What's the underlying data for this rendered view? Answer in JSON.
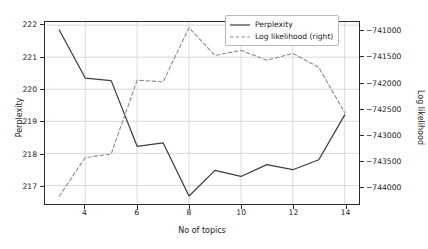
{
  "chart_data": {
    "type": "line",
    "title": "",
    "xlabel": "No of topics",
    "ylabel": "Perplexity",
    "y2label": "Log likelihood",
    "grid": true,
    "legend_position": "top-right",
    "x": [
      3,
      4,
      5,
      6,
      7,
      8,
      9,
      10,
      11,
      12,
      13,
      14
    ],
    "xlim": [
      2.45,
      14.55
    ],
    "xticks": [
      4,
      6,
      8,
      10,
      12,
      14
    ],
    "ylim": [
      216.42,
      222.1
    ],
    "yticks": [
      217,
      218,
      219,
      220,
      221,
      222
    ],
    "y2lim": [
      -744350,
      -740820
    ],
    "y2ticks": [
      -741000,
      -741500,
      -742000,
      -742500,
      -743000,
      -743500,
      -744000
    ],
    "series": [
      {
        "name": "Perplexity",
        "axis": "left",
        "style": "solid",
        "color": "#3d3d3d",
        "values": [
          221.85,
          220.35,
          220.27,
          218.22,
          218.33,
          216.67,
          217.47,
          217.28,
          217.65,
          217.49,
          217.8,
          219.2
        ]
      },
      {
        "name": "Log likelihood (right)",
        "axis": "right",
        "style": "dashed",
        "color": "#8a8a8a",
        "values": [
          -744200,
          -743450,
          -743380,
          -741950,
          -741980,
          -740930,
          -741470,
          -741370,
          -741560,
          -741430,
          -741700,
          -742580
        ]
      }
    ]
  },
  "legend": {
    "entries": [
      {
        "label": "Perplexity"
      },
      {
        "label": "Log likelihood (right)"
      }
    ]
  }
}
